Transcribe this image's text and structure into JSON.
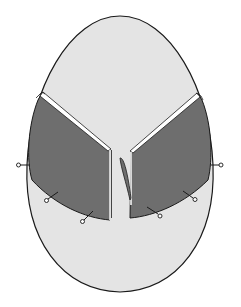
{
  "figure": {
    "colors": {
      "background": "#ffffff",
      "oval_fill": "#e4e4e4",
      "flap_fill": "#6e6e6e",
      "outline": "#1a1a1a",
      "flap_edge_highlight": "#ffffff"
    },
    "elements": {
      "oval": "egg-outline",
      "left_flap": "left-flap",
      "right_flap": "right-flap",
      "center_sliver": "center-curved-sliver",
      "pins_count": 6
    }
  }
}
